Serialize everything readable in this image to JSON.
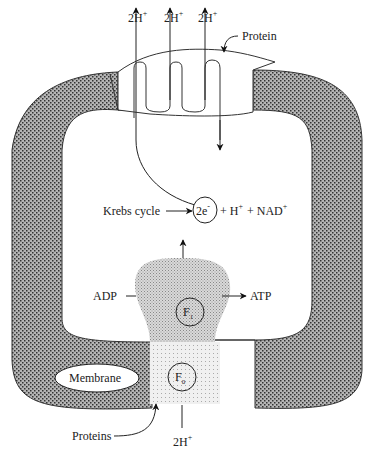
{
  "diagram": {
    "type": "mitochondrial ATP synthesis / chemiosmosis",
    "labels": {
      "top_protons": [
        "2H",
        "2H",
        "2H"
      ],
      "proton_sup": "+",
      "protein_top": "Protein",
      "krebs": "Krebs cycle",
      "electrons": "2e",
      "electrons_sup": "-",
      "plus1": "+ H",
      "h_sup": "+",
      "plus2": "+ NAD",
      "nad_sup": "+",
      "adp": "ADP",
      "atp": "ATP",
      "f1": "F",
      "f1_sub": "1",
      "f0": "F",
      "f0_sub": "0",
      "membrane": "Membrane",
      "proteins_bottom": "Proteins",
      "bottom_proton": "2H",
      "bottom_proton_sup": "+"
    },
    "colors": {
      "membrane_fill": "#8a8a8a",
      "f1_fill": "#cfcfcf",
      "f0_fill": "#e6e6e6",
      "line": "#222222"
    }
  }
}
